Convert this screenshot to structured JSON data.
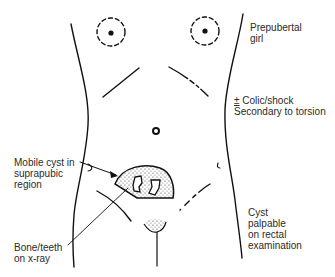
{
  "figure": {
    "ink_color": "#111111",
    "text_color": "#2a2a2a"
  },
  "labels": {
    "prepubertal": "Prepubertal\ngirl",
    "colic_symbol": "±",
    "colic": " Colic/shock",
    "secondary": "Secondary to torsion",
    "mobile_cyst": "Mobile cyst in\nsuprapubic\nregion",
    "bone_teeth": "Bone/teeth\non x-ray",
    "rectal": "Cyst\npalpable\non rectal\nexamination"
  }
}
